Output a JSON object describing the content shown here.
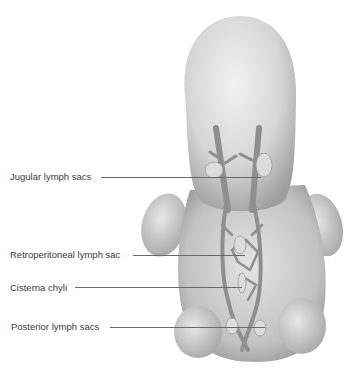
{
  "figure": {
    "labels": [
      {
        "id": "jugular",
        "text": "Jugular lymph sacs"
      },
      {
        "id": "retroperitoneal",
        "text": "Retroperitoneal lymph sac"
      },
      {
        "id": "cisterna",
        "text": "Cisterna chyli"
      },
      {
        "id": "posterior",
        "text": "Posterior lymph sacs"
      }
    ],
    "colors": {
      "skin_light": "#e6e6e6",
      "skin_mid": "#c8c8c8",
      "skin_dark": "#9a9a9a",
      "vessel": "#8f8f8f",
      "sac": "#dcdcdc",
      "leader_line": "#6a6a6a",
      "text": "#3a3a3a"
    }
  }
}
